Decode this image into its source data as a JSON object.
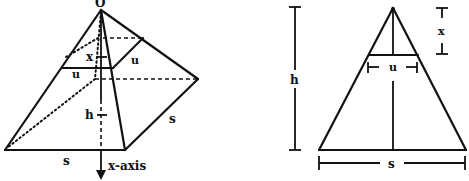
{
  "figures": {
    "pyramid": {
      "description": "Square pyramid with horizontal square cross-section at depth x, x-axis pointing downward from apex",
      "labels": {
        "apex": "O",
        "depth": "x",
        "section_side_front": "u",
        "section_side_right": "u",
        "height": "h",
        "base_side_right": "s",
        "base_side_front": "s",
        "axis": "x-axis"
      }
    },
    "triangle": {
      "description": "Side cross-section of pyramid showing similar triangles",
      "labels": {
        "height": "h",
        "depth": "x",
        "section_width": "u",
        "base_width": "s"
      }
    }
  },
  "colors": {
    "ink": "#111111",
    "background": "#ffffff"
  }
}
